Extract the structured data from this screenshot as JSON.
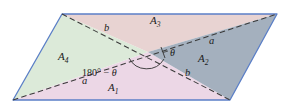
{
  "figure": {
    "type": "geometry-diagram",
    "background_color": "#ffffff",
    "outline_color": "#5b7fc7",
    "diagonal_color": "#3a3a3a",
    "canvas": {
      "width": 287,
      "height": 108
    },
    "parallelogram": {
      "vertices": [
        {
          "name": "bottom-left",
          "x": 13,
          "y": 100
        },
        {
          "name": "top-left",
          "x": 62,
          "y": 14
        },
        {
          "name": "top-right",
          "x": 277,
          "y": 14
        },
        {
          "name": "bottom-right",
          "x": 230,
          "y": 100
        }
      ],
      "intersection": {
        "x": 148,
        "y": 52
      }
    },
    "regions": [
      {
        "id": "A1",
        "label": "A",
        "subscript": "1",
        "color": "#ecd7e6",
        "label_x": 113,
        "label_y": 88
      },
      {
        "id": "A2",
        "label": "A",
        "subscript": "2",
        "color": "#a4b0be",
        "label_x": 203,
        "label_y": 59
      },
      {
        "id": "A3",
        "label": "A",
        "subscript": "3",
        "color": "#e8d3d2",
        "label_x": 155,
        "label_y": 21
      },
      {
        "id": "A4",
        "label": "A",
        "subscript": "4",
        "color": "#dcead9",
        "label_x": 63,
        "label_y": 57
      }
    ],
    "side_labels": [
      {
        "id": "b-top",
        "text": "b",
        "x": 107,
        "y": 28
      },
      {
        "id": "a-right",
        "text": "a",
        "x": 212,
        "y": 42
      },
      {
        "id": "b-lower-right",
        "text": "b",
        "x": 188,
        "y": 73
      },
      {
        "id": "a-lower-left",
        "text": "a",
        "x": 85,
        "y": 81
      }
    ],
    "angle_labels": [
      {
        "id": "theta",
        "text": "θ",
        "x": 172,
        "y": 54
      },
      {
        "id": "supplement",
        "number": "180",
        "degree": "°",
        "operator": " − ",
        "symbol": "θ",
        "x": 106,
        "y": 74
      }
    ],
    "arc_marks": [
      {
        "id": "theta-arc",
        "kind": "right-angle-tick"
      },
      {
        "id": "supplement-arc",
        "kind": "arc"
      }
    ]
  }
}
